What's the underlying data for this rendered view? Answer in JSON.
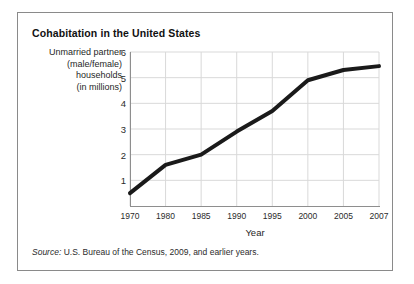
{
  "figure": {
    "title": "Cohabitation in the United States",
    "source_label": "Source:",
    "source_text": " U.S. Bureau of the Census, 2009, and earlier years."
  },
  "chart_data": {
    "type": "line",
    "title": "Cohabitation in the United States",
    "xlabel": "Year",
    "ylabel": "Unmarried partner (male/female) households (in millions)",
    "ylabel_lines": [
      "Unmarried partner",
      "(male/female)",
      "households",
      "(in millions)"
    ],
    "categories": [
      "1970",
      "1980",
      "1985",
      "1990",
      "1995",
      "2000",
      "2005",
      "2007"
    ],
    "x": [
      1970,
      1980,
      1985,
      1990,
      1995,
      2000,
      2005,
      2007
    ],
    "values": [
      0.5,
      1.6,
      2.0,
      2.9,
      3.7,
      4.9,
      5.3,
      5.45
    ],
    "series": [
      {
        "name": "Unmarried partner households (in millions)",
        "values": [
          0.5,
          1.6,
          2.0,
          2.9,
          3.7,
          4.9,
          5.3,
          5.45
        ]
      }
    ],
    "ylim": [
      0,
      6
    ],
    "yticks": [
      1,
      2,
      3,
      4,
      5,
      6
    ],
    "ytick_labels": [
      "1",
      "2",
      "3",
      "4",
      "5",
      "6"
    ],
    "xticks_even_spacing": true,
    "grid": true,
    "grid_color": "#d9d9d9",
    "legend": "none",
    "line_color": "#1a1a1a",
    "line_width": 4,
    "axis_color": "#8e8e8e"
  }
}
